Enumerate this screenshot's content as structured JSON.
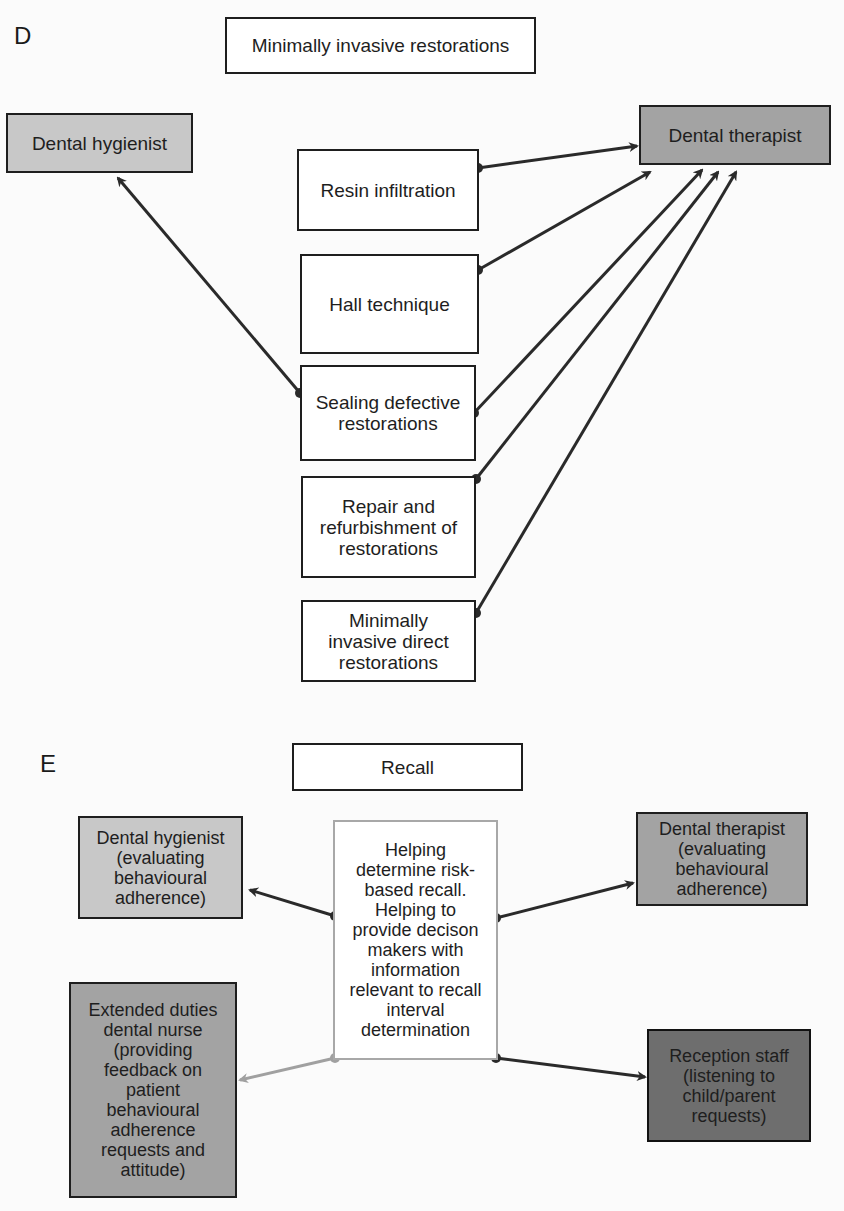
{
  "panel_d": {
    "label": "D",
    "title": "Minimally invasive restorations",
    "left_role": "Dental hygienist",
    "right_role": "Dental therapist",
    "techniques": [
      "Resin infiltration",
      "Hall technique",
      "Sealing defective\nrestorations",
      "Repair and\nrefurbishment of\nrestorations",
      "Minimally\ninvasive direct\nrestorations"
    ],
    "links": [
      {
        "from": "Resin infiltration",
        "to": "Dental therapist"
      },
      {
        "from": "Hall technique",
        "to": "Dental therapist"
      },
      {
        "from": "Sealing defective restorations",
        "to": "Dental hygienist"
      },
      {
        "from": "Sealing defective restorations",
        "to": "Dental therapist"
      },
      {
        "from": "Repair and refurbishment of restorations",
        "to": "Dental therapist"
      },
      {
        "from": "Minimally invasive direct restorations",
        "to": "Dental therapist"
      }
    ]
  },
  "panel_e": {
    "label": "E",
    "title": "Recall",
    "center": "Helping\ndetermine risk-\nbased recall.\nHelping to\nprovide decison\nmakers with\ninformation\nrelevant to recall\ninterval\ndetermination",
    "top_left": "Dental hygienist\n(evaluating\nbehavioural\nadherence)",
    "top_right": "Dental therapist\n(evaluating\nbehavioural\nadherence)",
    "bottom_left": "Extended duties\ndental nurse\n(providing\nfeedback on\npatient\nbehavioural\nadherence\nrequests and\nattitude)",
    "bottom_right": "Reception staff\n(listening to\nchild/parent\nrequests)"
  },
  "colors": {
    "line_dark": "#2a2a2a",
    "line_light": "#a0a0a0",
    "fill_light": "#c8c8c8",
    "fill_mid": "#a3a3a3",
    "fill_dark": "#6e6e6e"
  }
}
